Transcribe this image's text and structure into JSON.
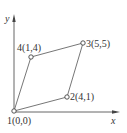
{
  "diagram": {
    "type": "quadrilateral-element",
    "axes": {
      "x_label": "x",
      "y_label": "y"
    },
    "nodes": [
      {
        "id": "1",
        "label": "1(0,0)",
        "x": 0,
        "y": 0
      },
      {
        "id": "2",
        "label": "2(4,1)",
        "x": 4,
        "y": 1
      },
      {
        "id": "3",
        "label": "3(5,5)",
        "x": 5,
        "y": 5
      },
      {
        "id": "4",
        "label": "4(1,4)",
        "x": 1,
        "y": 4
      }
    ],
    "edges": [
      [
        "1",
        "2"
      ],
      [
        "2",
        "3"
      ],
      [
        "3",
        "4"
      ],
      [
        "4",
        "1"
      ]
    ],
    "colors": {
      "line": "#555555",
      "text": "#333333",
      "background": "#ffffff"
    }
  }
}
